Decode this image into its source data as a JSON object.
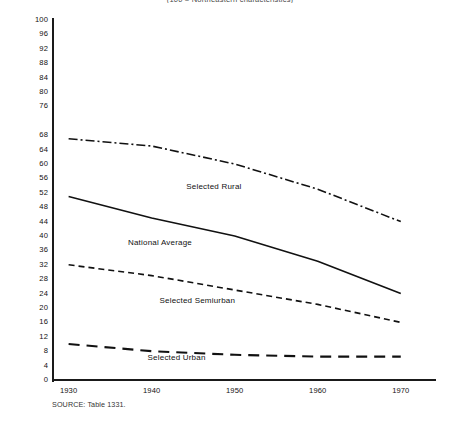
{
  "chart_data": {
    "type": "line",
    "title": "(100 = Northeastern characteristics)",
    "xlabel": "",
    "ylabel": "",
    "x": [
      1930,
      1940,
      1950,
      1960,
      1970
    ],
    "xlim": [
      1928,
      1974
    ],
    "ylim": [
      0,
      100
    ],
    "y_ticks": [
      0,
      4,
      8,
      12,
      16,
      20,
      24,
      28,
      32,
      36,
      40,
      44,
      48,
      52,
      56,
      60,
      64,
      68,
      76,
      80,
      84,
      88,
      92,
      96,
      100
    ],
    "x_ticks": [
      "1930",
      "1940",
      "1950",
      "1960",
      "1970"
    ],
    "grid": false,
    "legend_position": "inline-annotations",
    "series": [
      {
        "name": "Selected Rural",
        "style": "dash-dot",
        "label_x": 1947.5,
        "label_y": 53.5,
        "values": [
          67,
          65,
          60,
          53,
          44
        ]
      },
      {
        "name": "National Average",
        "style": "solid",
        "label_x": 1941.0,
        "label_y": 38.0,
        "values": [
          51,
          45,
          40,
          33,
          24
        ]
      },
      {
        "name": "Selected Semiurban",
        "style": "dashed-short",
        "label_x": 1945.5,
        "label_y": 22.0,
        "values": [
          32,
          29,
          25,
          21,
          16
        ]
      },
      {
        "name": "Selected Urban",
        "style": "dashed-long",
        "label_x": 1943.0,
        "label_y": 6.0,
        "values": [
          10,
          8,
          7,
          6.5,
          6.5
        ]
      }
    ]
  },
  "source": {
    "note": "SOURCE: Table 1331."
  }
}
